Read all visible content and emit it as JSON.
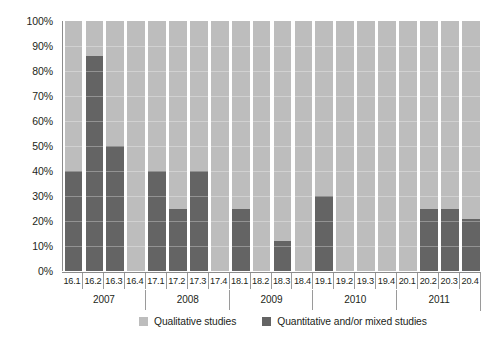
{
  "chart_data": {
    "type": "bar",
    "subtype": "stacked-percent",
    "title": "",
    "subtitle": "",
    "xlabel": "",
    "ylabel": "",
    "ylim": [
      0,
      100
    ],
    "y_unit": "%",
    "grid": true,
    "legend_position": "bottom",
    "categories": [
      "16.1",
      "16.2",
      "16.3",
      "16.4",
      "17.1",
      "17.2",
      "17.3",
      "17.4",
      "18.1",
      "18.2",
      "18.3",
      "18.4",
      "19.1",
      "19.2",
      "19.3",
      "19.4",
      "20.1",
      "20.2",
      "20.3",
      "20.4"
    ],
    "group_labels": [
      "2007",
      "2008",
      "2009",
      "2010",
      "2011"
    ],
    "group_size": 4,
    "y_tick_labels": [
      "100%",
      "90%",
      "80%",
      "70%",
      "60%",
      "50%",
      "40%",
      "30%",
      "20%",
      "10%",
      "0%"
    ],
    "y_tick_values": [
      100,
      90,
      80,
      70,
      60,
      50,
      40,
      30,
      20,
      10,
      0
    ],
    "series": [
      {
        "name": "Qualitative studies",
        "color": "#bdbdbd",
        "values": [
          60,
          14,
          50,
          100,
          60,
          75,
          60,
          100,
          75,
          100,
          88,
          100,
          70,
          100,
          100,
          100,
          100,
          75,
          75,
          79
        ]
      },
      {
        "name": "Quantitative and/or mixed studies",
        "color": "#646464",
        "values": [
          40,
          86,
          50,
          0,
          40,
          25,
          40,
          0,
          25,
          0,
          12,
          0,
          30,
          0,
          0,
          0,
          0,
          25,
          25,
          21
        ]
      }
    ]
  },
  "legend": {
    "items": [
      {
        "label": "Qualitative studies",
        "swatch": "light-gray-swatch",
        "color": "#bdbdbd"
      },
      {
        "label": "Quantitative and/or mixed studies",
        "swatch": "dark-gray-swatch",
        "color": "#646464"
      }
    ]
  },
  "colors": {
    "qualitative": "#bdbdbd",
    "quantitative": "#646464",
    "axis": "#8c8c8c",
    "text": "#231f20",
    "background": "#ffffff"
  }
}
